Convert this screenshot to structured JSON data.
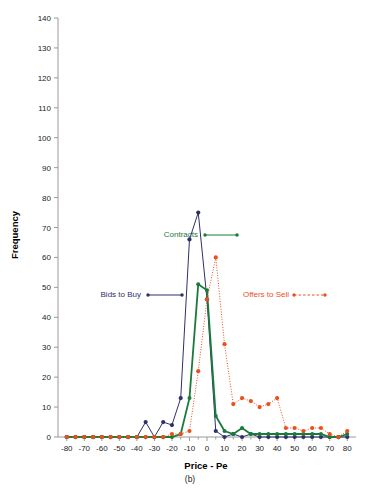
{
  "figure": {
    "caption": "(b)",
    "background": "#ffffff"
  },
  "chart_data": {
    "type": "line",
    "title": "",
    "xlabel": "Price - Pe",
    "ylabel": "Frequency",
    "xlim": [
      -85,
      85
    ],
    "ylim": [
      0,
      140
    ],
    "xticks": [
      -80,
      -70,
      -60,
      -50,
      -40,
      -30,
      -20,
      -10,
      0,
      10,
      20,
      30,
      40,
      50,
      60,
      70,
      80
    ],
    "yticks": [
      0,
      10,
      20,
      30,
      40,
      50,
      60,
      70,
      80,
      90,
      100,
      110,
      120,
      130,
      140
    ],
    "xtick_labels": [
      "-80",
      "-70",
      "-60",
      "-50",
      "-40",
      "-30",
      "-20",
      "-10",
      "0",
      "10",
      "20",
      "30",
      "40",
      "50",
      "60",
      "70",
      "80"
    ],
    "ytick_labels": [
      "0",
      "10",
      "20",
      "30",
      "40",
      "50",
      "60",
      "70",
      "80",
      "90",
      "100",
      "110",
      "120",
      "130",
      "140"
    ],
    "grid": false,
    "legend_position": "inline-annotations",
    "x": [
      -80,
      -75,
      -70,
      -65,
      -60,
      -55,
      -50,
      -45,
      -40,
      -35,
      -30,
      -25,
      -20,
      -15,
      -10,
      -5,
      0,
      5,
      10,
      15,
      20,
      25,
      30,
      35,
      40,
      45,
      50,
      55,
      60,
      65,
      70,
      75,
      80
    ],
    "series": [
      {
        "name": "Bids to Buy",
        "color": "#2f2f6b",
        "linestyle": "solid",
        "marker": "circle",
        "values": [
          0,
          0,
          0,
          0,
          0,
          0,
          0,
          0,
          0,
          5,
          0,
          5,
          4,
          13,
          66,
          75,
          46,
          2,
          0,
          1,
          0,
          1,
          0,
          0,
          0,
          0,
          0,
          0,
          0,
          0,
          0,
          0,
          0
        ]
      },
      {
        "name": "Contracts",
        "color": "#1a7a3a",
        "linestyle": "solid",
        "marker": "circle",
        "values": [
          0,
          0,
          0,
          0,
          0,
          0,
          0,
          0,
          0,
          0,
          0,
          0,
          0,
          1,
          13,
          51,
          49,
          7,
          2,
          1,
          3,
          1,
          1,
          1,
          1,
          1,
          1,
          1,
          1,
          1,
          0,
          0,
          1
        ]
      },
      {
        "name": "Offers to Sell",
        "color": "#e8501e",
        "linestyle": "dotted",
        "marker": "circle",
        "values": [
          0,
          0,
          0,
          0,
          0,
          0,
          0,
          0,
          0,
          0,
          0,
          0,
          1,
          1,
          2,
          22,
          46,
          60,
          31,
          11,
          13,
          12,
          10,
          11,
          13,
          3,
          3,
          2,
          3,
          3,
          1,
          0,
          2
        ]
      }
    ],
    "annotations": [
      {
        "id": "contracts-annotation",
        "text": "Contracts",
        "color": "#1a7a3a",
        "linestyle": "solid",
        "text_x": 198,
        "text_y": 237,
        "line_x1": 205,
        "line_x2": 237,
        "line_y": 235
      },
      {
        "id": "bids-annotation",
        "text": "Bids to Buy",
        "color": "#2f2f6b",
        "linestyle": "solid",
        "text_x": 141,
        "text_y": 297,
        "line_x1": 148,
        "line_x2": 182,
        "line_y": 295
      },
      {
        "id": "offers-annotation",
        "text": "Offers to Sell",
        "color": "#e8501e",
        "linestyle": "dotted",
        "text_x": 289,
        "text_y": 297,
        "line_x1": 294,
        "line_x2": 325,
        "line_y": 295
      }
    ]
  }
}
